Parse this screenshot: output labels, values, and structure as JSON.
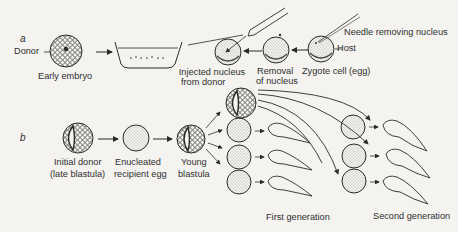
{
  "panel_a": {
    "letter": "a",
    "donor_label": "Donor",
    "early_embryo_label": "Early embryo",
    "injected_label_line1": "Injected nucleus",
    "injected_label_line2": "from donor",
    "removal_label_line1": "Removal",
    "removal_label_line2": "of nucleus",
    "zygote_label": "Zygote cell  (egg)",
    "host_label": "Host",
    "needle_label": "Needle removing nucleus"
  },
  "panel_b": {
    "letter": "b",
    "initial_donor_line1": "Initial donor",
    "initial_donor_line2": "(late blastula)",
    "enucleated_line1": "Enucleated",
    "enucleated_line2": "recipient egg",
    "young_blastula_line1": "Young",
    "young_blastula_line2": "blastula",
    "first_generation": "First generation",
    "second_generation": "Second generation"
  },
  "colors": {
    "background": "#f4f3ef",
    "ink": "#2a2a2a"
  }
}
